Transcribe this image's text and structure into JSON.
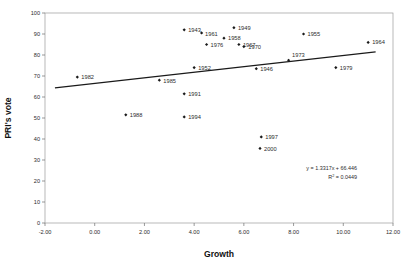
{
  "chart_data": {
    "type": "scatter",
    "title": "",
    "xlabel": "Growth",
    "ylabel": "PRI's vote",
    "xlim": [
      -2.0,
      12.0
    ],
    "ylim": [
      0,
      100
    ],
    "grid": false,
    "legend": "none",
    "x_ticks": [
      "-2.00",
      "0.00",
      "2.00",
      "4.00",
      "6.00",
      "8.00",
      "10.00",
      "12.00"
    ],
    "x_tick_values": [
      -2,
      0,
      2,
      4,
      6,
      8,
      10,
      12
    ],
    "y_ticks": [
      "0",
      "10",
      "20",
      "30",
      "40",
      "50",
      "60",
      "70",
      "80",
      "90",
      "100"
    ],
    "y_tick_values": [
      0,
      10,
      20,
      30,
      40,
      50,
      60,
      70,
      80,
      90,
      100
    ],
    "point_labels": [
      "1943",
      "1961",
      "1949",
      "1958",
      "1976",
      "1967",
      "1970",
      "1955",
      "1964",
      "1973",
      "1952",
      "1946",
      "1979",
      "1982",
      "1985",
      "1991",
      "1994",
      "1988",
      "1997",
      "2000"
    ],
    "x": [
      3.6,
      4.3,
      5.6,
      5.2,
      4.5,
      5.8,
      6.0,
      8.4,
      11.0,
      7.8,
      4.0,
      6.5,
      9.7,
      -0.7,
      2.6,
      3.6,
      3.6,
      1.25,
      6.7,
      6.65
    ],
    "y": [
      92.0,
      90.5,
      93.0,
      88.0,
      85.0,
      85.0,
      84.0,
      90.0,
      86.0,
      77.5,
      74.0,
      73.5,
      74.0,
      69.5,
      68.0,
      61.5,
      50.5,
      51.5,
      41.0,
      35.5
    ],
    "points": [
      {
        "label": "1943",
        "x": 3.6,
        "y": 92.0,
        "label_dx": 4,
        "label_dy": 2.0
      },
      {
        "label": "1961",
        "x": 4.3,
        "y": 90.5,
        "label_dx": 3.5,
        "label_dy": 2.6
      },
      {
        "label": "1949",
        "x": 5.6,
        "y": 93.0,
        "label_dx": 4,
        "label_dy": 2.0
      },
      {
        "label": "1958",
        "x": 5.2,
        "y": 88.0,
        "label_dx": 4,
        "label_dy": 2.0
      },
      {
        "label": "1976",
        "x": 4.5,
        "y": 85.0,
        "label_dx": 4,
        "label_dy": 2.6
      },
      {
        "label": "1967",
        "x": 5.8,
        "y": 85.0,
        "label_dx": 4,
        "label_dy": 2.4
      },
      {
        "label": "1970",
        "x": 6.0,
        "y": 84.0,
        "label_dx": 4.5,
        "label_dy": 2.8
      },
      {
        "label": "1955",
        "x": 8.4,
        "y": 90.0,
        "label_dx": 4,
        "label_dy": 2.0
      },
      {
        "label": "1964",
        "x": 11.0,
        "y": 86.0,
        "label_dx": 4,
        "label_dy": 2.0
      },
      {
        "label": "1973",
        "x": 7.8,
        "y": 77.5,
        "label_dx": 3.5,
        "label_dy": -3.0
      },
      {
        "label": "1952",
        "x": 4.0,
        "y": 74.0,
        "label_dx": 4,
        "label_dy": 2.0
      },
      {
        "label": "1946",
        "x": 6.5,
        "y": 73.5,
        "label_dx": 4,
        "label_dy": 2.4
      },
      {
        "label": "1979",
        "x": 9.7,
        "y": 74.0,
        "label_dx": 4,
        "label_dy": 2.0
      },
      {
        "label": "1982",
        "x": -0.7,
        "y": 69.5,
        "label_dx": 4,
        "label_dy": 2.0
      },
      {
        "label": "1985",
        "x": 2.6,
        "y": 68.0,
        "label_dx": 4,
        "label_dy": 2.4
      },
      {
        "label": "1991",
        "x": 3.6,
        "y": 61.5,
        "label_dx": 4,
        "label_dy": 2.2
      },
      {
        "label": "1994",
        "x": 3.6,
        "y": 50.5,
        "label_dx": 4,
        "label_dy": 2.2
      },
      {
        "label": "1988",
        "x": 1.25,
        "y": 51.5,
        "label_dx": 4,
        "label_dy": 2.2
      },
      {
        "label": "1997",
        "x": 6.7,
        "y": 41.0,
        "label_dx": 4,
        "label_dy": 2.2
      },
      {
        "label": "2000",
        "x": 6.65,
        "y": 35.5,
        "label_dx": 4,
        "label_dy": 2.2
      }
    ],
    "trendline": {
      "slope": 1.3317,
      "intercept": 66.446,
      "x_start": -1.6,
      "x_end": 11.3,
      "equation": "y = 1.3317x + 66.446",
      "r_squared_label": "R",
      "r_squared_sup": "2",
      "r_squared_value": " = 0.0449"
    }
  }
}
